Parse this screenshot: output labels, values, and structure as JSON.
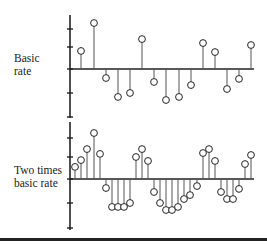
{
  "chart_data": [
    {
      "type": "stem",
      "title": "",
      "ylabel": "Basic rate",
      "xlabel": "",
      "axis": {
        "x": 70,
        "baseline_y": 69,
        "top": 15,
        "bottom": 118,
        "right": 254,
        "ticks_y": [
          29,
          47,
          69,
          93,
          117
        ],
        "unit_px": 22
      },
      "x_px": [
        81,
        94,
        106,
        118,
        130,
        142,
        154,
        166,
        179,
        191,
        203,
        215,
        227,
        239,
        251
      ],
      "values": [
        0.82,
        2.09,
        -0.41,
        -1.27,
        -1.09,
        1.36,
        -0.59,
        -1.41,
        -1.27,
        -0.73,
        1.18,
        0.77,
        -0.91,
        -0.45,
        1.09
      ],
      "grid": false
    },
    {
      "type": "stem",
      "title": "",
      "ylabel": "Two times basic rate",
      "xlabel": "",
      "axis": {
        "x": 70,
        "baseline_y": 179,
        "top": 122,
        "bottom": 230,
        "right": 254,
        "ticks_y": [
          138,
          157,
          179,
          203,
          228
        ],
        "unit_px": 22
      },
      "x_px": [
        75,
        81,
        87,
        94,
        100,
        106,
        112,
        118,
        124,
        130,
        136,
        142,
        148,
        154,
        160,
        166,
        172,
        178,
        184,
        190,
        197,
        203,
        209,
        215,
        221,
        227,
        233,
        239,
        245,
        251
      ],
      "values": [
        0.55,
        0.86,
        1.36,
        2.09,
        1.14,
        -0.41,
        -1.27,
        -1.27,
        -1.27,
        -1.09,
        1.0,
        1.36,
        0.82,
        -0.59,
        -1.09,
        -1.41,
        -1.41,
        -1.27,
        -0.91,
        -0.73,
        -0.32,
        1.18,
        1.36,
        0.82,
        -0.59,
        -0.91,
        -0.91,
        -0.45,
        0.68,
        1.09
      ],
      "grid": false
    }
  ],
  "labels": {
    "top_line1": "Basic",
    "top_line2": "rate",
    "bottom_line1": "Two times",
    "bottom_line2": "basic rate"
  },
  "colors": {
    "ink": "#222222",
    "stem": "#555555"
  }
}
